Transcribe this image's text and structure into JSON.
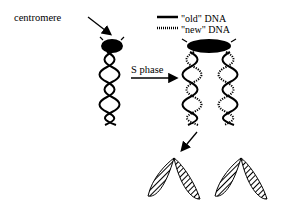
{
  "diagram": {
    "labels": {
      "centromere": "centromere",
      "s_phase": "S phase"
    },
    "legend": {
      "old_dna": "\"old\" DNA",
      "new_dna": "\"new\" DNA"
    },
    "colors": {
      "ink": "#000000",
      "background": "#ffffff"
    }
  }
}
